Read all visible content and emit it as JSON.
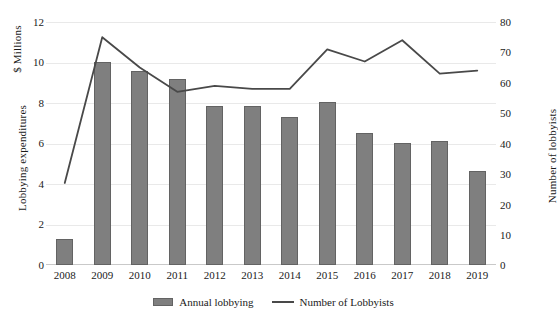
{
  "chart_data": {
    "type": "bar",
    "title": "",
    "xlabel": "",
    "ylabel": "Lobbying expenditures",
    "y_unit_label": "$ Millions",
    "y2label": "Number of lobbyists",
    "ylim": [
      0,
      12
    ],
    "y2lim": [
      0,
      80
    ],
    "yticks": [
      "0",
      "2",
      "4",
      "6",
      "8",
      "10",
      "12"
    ],
    "y2ticks": [
      "0",
      "10",
      "20",
      "30",
      "40",
      "50",
      "60",
      "70",
      "80"
    ],
    "grid": true,
    "legend_position": "bottom",
    "categories": [
      "2008",
      "2009",
      "2010",
      "2011",
      "2012",
      "2013",
      "2014",
      "2015",
      "2016",
      "2017",
      "2018",
      "2019"
    ],
    "series": [
      {
        "name": "Annual lobbying",
        "type": "bar",
        "axis": "left",
        "color": "#7f7f7f",
        "values": [
          1.3,
          10.05,
          9.6,
          9.2,
          7.85,
          7.85,
          7.3,
          8.05,
          6.5,
          6.05,
          6.1,
          4.65
        ]
      },
      {
        "name": "Number of Lobbyists",
        "type": "line",
        "axis": "right",
        "color": "#494949",
        "values": [
          27,
          75,
          65,
          57,
          59,
          58,
          58,
          71,
          67,
          74,
          63,
          64
        ]
      }
    ]
  },
  "legend": {
    "bar_label": "Annual lobbying",
    "line_label": "Number of Lobbyists"
  }
}
